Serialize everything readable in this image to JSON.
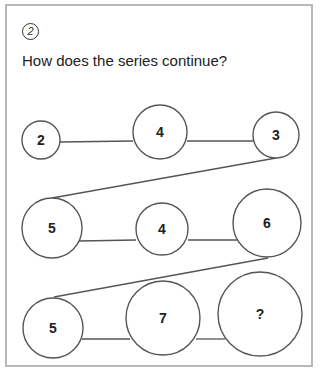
{
  "question": {
    "number": "2",
    "text": "How does the series continue?"
  },
  "puzzle": {
    "rows": [
      [
        {
          "label": "2",
          "cx": 41,
          "cy": 140,
          "r": 19
        },
        {
          "label": "4",
          "cx": 160,
          "cy": 132,
          "r": 27
        },
        {
          "label": "3",
          "cx": 276,
          "cy": 135,
          "r": 23
        }
      ],
      [
        {
          "label": "5",
          "cx": 52,
          "cy": 228,
          "r": 30
        },
        {
          "label": "4",
          "cx": 162,
          "cy": 229,
          "r": 26
        },
        {
          "label": "6",
          "cx": 267,
          "cy": 223,
          "r": 34
        }
      ],
      [
        {
          "label": "5",
          "cx": 53,
          "cy": 328,
          "r": 30
        },
        {
          "label": "7",
          "cx": 163,
          "cy": 318,
          "r": 37
        },
        {
          "label": "?",
          "cx": 260,
          "cy": 314,
          "r": 42
        }
      ]
    ]
  }
}
